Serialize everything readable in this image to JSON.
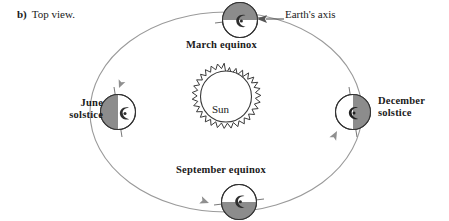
{
  "figure": {
    "caption_letter": "b)",
    "caption_text": "Top view."
  },
  "sun": {
    "label": "Sun",
    "center_x": 226,
    "center_y": 110,
    "radius": 26,
    "corona_label": "solar-corona",
    "fill": "#ffffff",
    "stroke": "#3a3a3a"
  },
  "orbit": {
    "center_x": 226,
    "center_y": 112,
    "radius_x": 136,
    "radius_y": 100,
    "stroke": "#9a9a9a",
    "direction": "counterclockwise",
    "arrows": [
      {
        "name": "orbit-arrow-toward-june",
        "x": 119,
        "y": 88,
        "rotation": 115
      },
      {
        "name": "orbit-arrow-toward-september",
        "x": 206,
        "y": 202,
        "rotation": 22
      },
      {
        "name": "orbit-arrow-toward-december",
        "x": 337,
        "y": 133,
        "rotation": -62
      }
    ]
  },
  "earth_axis_callout": {
    "label": "Earth's axis",
    "arrow_name": "earth-axis-leader-arrow",
    "leader_from_x": 284,
    "leader_to_x": 258,
    "leader_y": 19
  },
  "positions": [
    {
      "id": "march-equinox",
      "label": "March equinox",
      "label_lines": [
        "March equinox"
      ],
      "center_x": 240,
      "center_y": 20,
      "radius": 18,
      "shaded_half": "top",
      "axis_tilt_deg": 97,
      "fill_light": "#ffffff",
      "fill_dark": "#8c8c8c",
      "stroke": "#333333"
    },
    {
      "id": "june-solstice",
      "label": "June solstice",
      "label_lines": [
        "June",
        "solstice"
      ],
      "center_x": 118,
      "center_y": 112,
      "radius": 18,
      "shaded_half": "left",
      "axis_tilt_deg": 10,
      "fill_light": "#ffffff",
      "fill_dark": "#8c8c8c",
      "stroke": "#333333"
    },
    {
      "id": "september-equinox",
      "label": "September equinox",
      "label_lines": [
        "September  equinox"
      ],
      "center_x": 239,
      "center_y": 202,
      "radius": 18,
      "shaded_half": "bottom",
      "axis_tilt_deg": 97,
      "fill_light": "#ffffff",
      "fill_dark": "#8c8c8c",
      "stroke": "#333333"
    },
    {
      "id": "december-solstice",
      "label": "December solstice",
      "label_lines": [
        "December",
        "solstice"
      ],
      "center_x": 353,
      "center_y": 112,
      "radius": 18,
      "shaded_half": "right",
      "axis_tilt_deg": 10,
      "fill_light": "#ffffff",
      "fill_dark": "#8c8c8c",
      "stroke": "#333333"
    }
  ],
  "colors": {
    "background": "#ffffff",
    "ink": "#1a1a1a",
    "orbit_gray": "#9a9a9a",
    "earth_shadow": "#8c8c8c",
    "earth_outline": "#333333"
  }
}
